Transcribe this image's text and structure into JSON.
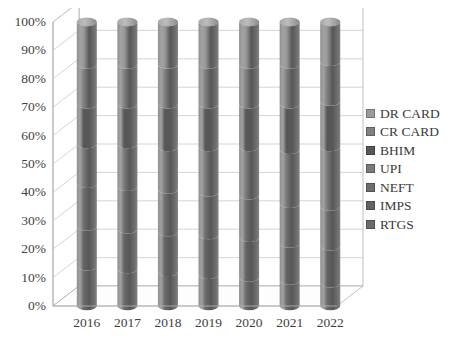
{
  "chart_data": {
    "type": "bar",
    "subtype": "100%-stacked-3d-cylinder",
    "title": "",
    "xlabel": "",
    "ylabel": "",
    "categories": [
      "2016",
      "2017",
      "2018",
      "2019",
      "2020",
      "2021",
      "2022"
    ],
    "ylim": [
      0,
      100
    ],
    "ytick_labels": [
      "0%",
      "10%",
      "20%",
      "30%",
      "40%",
      "50%",
      "60%",
      "70%",
      "80%",
      "90%",
      "100%"
    ],
    "ytick_values": [
      0,
      10,
      20,
      30,
      40,
      50,
      60,
      70,
      80,
      90,
      100
    ],
    "grid": true,
    "grid_axis": "y",
    "legend_position": "right",
    "series": [
      {
        "name": "RTGS",
        "color": "#6b6b6b",
        "values": [
          14,
          13,
          12,
          11,
          10,
          9,
          8
        ]
      },
      {
        "name": "IMPS",
        "color": "#636363",
        "values": [
          14,
          14,
          14,
          14,
          14,
          13,
          13
        ]
      },
      {
        "name": "NEFT",
        "color": "#6e6e6e",
        "values": [
          15,
          15,
          15,
          15,
          15,
          14,
          14
        ]
      },
      {
        "name": "UPI",
        "color": "#7a7a7a",
        "values": [
          14,
          15,
          15,
          16,
          17,
          19,
          21
        ]
      },
      {
        "name": "BHIM",
        "color": "#575757",
        "values": [
          14,
          14,
          15,
          15,
          15,
          16,
          16
        ]
      },
      {
        "name": "CR CARD",
        "color": "#808080",
        "values": [
          14,
          14,
          14,
          14,
          14,
          14,
          14
        ]
      },
      {
        "name": "DR CARD",
        "color": "#9a9a9a",
        "values": [
          15,
          15,
          15,
          15,
          15,
          15,
          14
        ]
      }
    ]
  },
  "legend": {
    "items": [
      {
        "label": "DR CARD",
        "color": "#9a9a9a"
      },
      {
        "label": "CR CARD",
        "color": "#808080"
      },
      {
        "label": "BHIM",
        "color": "#575757"
      },
      {
        "label": "UPI",
        "color": "#7a7a7a"
      },
      {
        "label": "NEFT",
        "color": "#6e6e6e"
      },
      {
        "label": "IMPS",
        "color": "#636363"
      },
      {
        "label": "RTGS",
        "color": "#6b6b6b"
      }
    ]
  },
  "style": {
    "background": "#ffffff",
    "gridline_color": "#c9c9c9",
    "axis_color": "#b0b0b0",
    "tick_text_color": "#3f3f3f",
    "cylinder_light": "#9c9c9c",
    "cylinder_mid": "#6a6a6a",
    "cylinder_dark": "#545454",
    "cylinder_top_light": "#b6b6b6"
  }
}
